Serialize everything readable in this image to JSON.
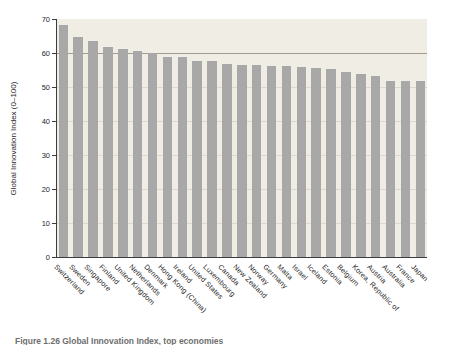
{
  "figure": {
    "caption": "Figure 1.26   Global Innovation Index, top economies"
  },
  "chart_data": {
    "type": "bar",
    "title": "",
    "xlabel": "",
    "ylabel": "Global Innovation Index (0–100)",
    "ylim": [
      0,
      70
    ],
    "yticks": [
      0,
      10,
      20,
      30,
      40,
      50,
      60,
      70
    ],
    "grid": "horizontal",
    "emphasized_gridline": 60,
    "legend": "none",
    "categories": [
      "Switzerland",
      "Sweden",
      "Singapore",
      "Finland",
      "United Kingdom",
      "Netherlands",
      "Denmark",
      "Hong Kong (China)",
      "Ireland",
      "United States",
      "Luxembourg",
      "Canada",
      "New Zealand",
      "Norway",
      "Germany",
      "Malta",
      "Israel",
      "Iceland",
      "Estonia",
      "Belgium",
      "Korea, Republic of",
      "Austria",
      "Australia",
      "France",
      "Japan"
    ],
    "values": [
      68.2,
      64.8,
      63.5,
      61.8,
      61.2,
      60.5,
      59.9,
      58.7,
      58.7,
      57.7,
      57.7,
      56.9,
      56.6,
      56.4,
      56.2,
      56.1,
      56.0,
      55.7,
      55.3,
      54.3,
      53.9,
      53.1,
      51.9,
      51.8,
      51.7
    ],
    "colors": {
      "bar": "#a8a8a8",
      "plot_background": "#f0ede5",
      "gridline": "#dcd8cc",
      "gridline_emphasis": "#a29c8e",
      "axis": "#3c3c3c",
      "text": "#1f1f1f"
    }
  }
}
